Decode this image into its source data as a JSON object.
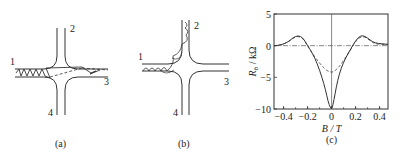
{
  "figure": {
    "panels": [
      {
        "id": "a",
        "caption": "(a)",
        "terminal_labels": [
          "1",
          "2",
          "3",
          "4"
        ],
        "description": "Cross junction; skipping orbit from lead 1 travels diagonally to lead 3"
      },
      {
        "id": "b",
        "caption": "(b)",
        "terminal_labels": [
          "1",
          "2",
          "3",
          "4"
        ],
        "description": "Cross junction; skipping orbit from lead 1 guided around corner into lead 2"
      }
    ]
  },
  "chart_data": {
    "type": "line",
    "caption": "(c)",
    "title": "",
    "xlabel": "B / T",
    "ylabel": "R_b / kΩ",
    "ylabel_main": "R",
    "ylabel_sub": "b",
    "ylabel_unit": " / kΩ",
    "xlim": [
      -0.48,
      0.47
    ],
    "ylim": [
      -10,
      5
    ],
    "xticks": [
      -0.4,
      -0.2,
      0,
      0.2,
      0.4
    ],
    "xtick_labels": [
      "−0.4",
      "−0.2",
      "0",
      "0.2",
      "0.4"
    ],
    "yticks": [
      5,
      0,
      -5,
      -10
    ],
    "ytick_labels": [
      "5",
      "0",
      "−5",
      "−10"
    ],
    "grid": false,
    "zero_lines": true,
    "series": [
      {
        "name": "experiment",
        "style": "solid",
        "x": [
          -0.48,
          -0.42,
          -0.36,
          -0.32,
          -0.28,
          -0.24,
          -0.2,
          -0.16,
          -0.12,
          -0.08,
          -0.05,
          -0.03,
          -0.01,
          0.0,
          0.01,
          0.03,
          0.05,
          0.08,
          0.12,
          0.16,
          0.2,
          0.24,
          0.28,
          0.32,
          0.36,
          0.42,
          0.47
        ],
        "y": [
          0.0,
          0.1,
          0.6,
          1.3,
          1.6,
          1.3,
          0.0,
          -1.2,
          -2.8,
          -5.0,
          -7.0,
          -8.8,
          -9.8,
          -10.0,
          -9.5,
          -7.5,
          -5.5,
          -3.5,
          -1.8,
          -0.5,
          0.8,
          1.6,
          1.5,
          0.9,
          0.4,
          0.3,
          0.2
        ]
      },
      {
        "name": "simulation",
        "style": "dashed",
        "x": [
          -0.48,
          -0.42,
          -0.36,
          -0.32,
          -0.28,
          -0.24,
          -0.2,
          -0.16,
          -0.12,
          -0.08,
          -0.05,
          -0.02,
          0.0,
          0.02,
          0.05,
          0.08,
          0.12,
          0.16,
          0.2,
          0.24,
          0.28,
          0.32,
          0.36,
          0.42,
          0.47
        ],
        "y": [
          0.0,
          0.1,
          0.6,
          1.2,
          1.5,
          1.2,
          0.0,
          -1.2,
          -2.3,
          -3.2,
          -3.8,
          -4.1,
          -4.2,
          -4.1,
          -3.6,
          -2.9,
          -1.8,
          -0.6,
          0.7,
          1.4,
          1.4,
          0.8,
          0.3,
          0.2,
          0.2
        ]
      }
    ]
  }
}
